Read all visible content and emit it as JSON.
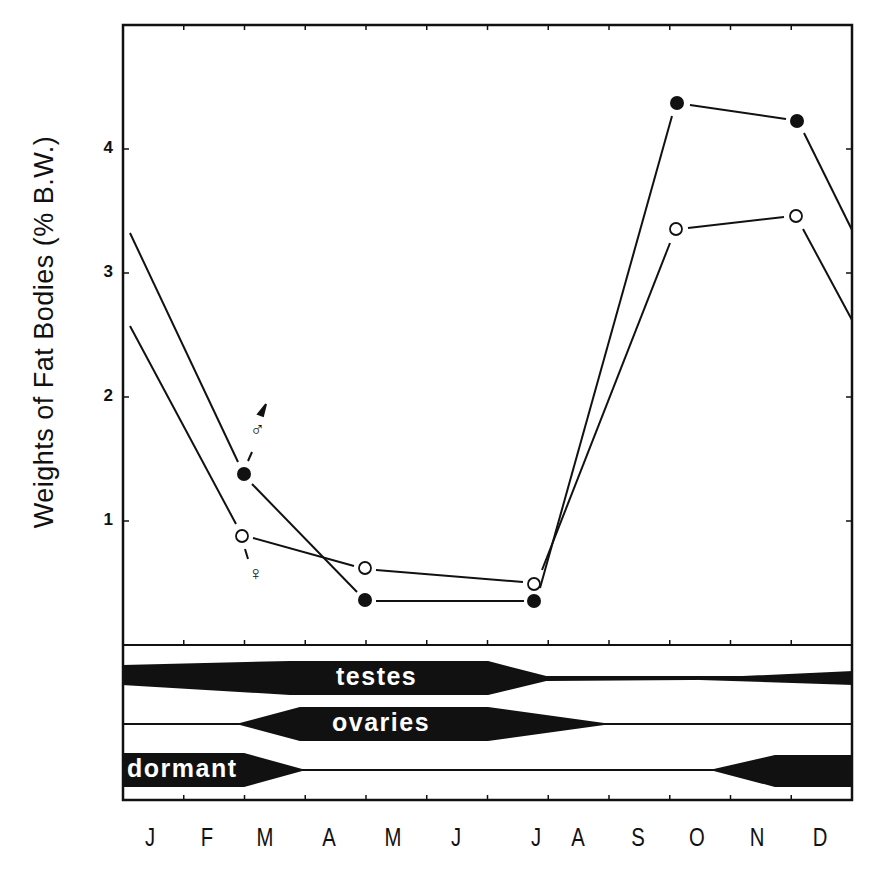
{
  "chart_data": {
    "type": "line",
    "title": "",
    "xlabel": "",
    "ylabel": "Weights of Fat Bodies  (% B.W.)",
    "categories": [
      "J",
      "F",
      "M",
      "A",
      "M",
      "J",
      "J",
      "A",
      "S",
      "O",
      "N",
      "D"
    ],
    "yticks": [
      "1",
      "2",
      "3",
      "4"
    ],
    "ylim": [
      0,
      4.9
    ],
    "grid": false,
    "legend": "inline labels: male symbol next to filled circles, female symbol next to open circles (near March)",
    "series": [
      {
        "name": "male",
        "marker": "filled-circle",
        "points": [
          {
            "month": "M",
            "value": 1.38
          },
          {
            "month": "M (May)",
            "value": 0.36
          },
          {
            "month": "J (Jul)",
            "value": 0.35
          },
          {
            "month": "O",
            "value": 4.36
          },
          {
            "month": "D",
            "value": 4.22
          }
        ],
        "edge_start_value": 3.32,
        "edge_end_value": 3.35
      },
      {
        "name": "female",
        "marker": "open-circle",
        "points": [
          {
            "month": "M",
            "value": 0.88
          },
          {
            "month": "M (May)",
            "value": 0.62
          },
          {
            "month": "J (Jul)",
            "value": 0.49
          },
          {
            "month": "O",
            "value": 3.35
          },
          {
            "month": "D",
            "value": 3.46
          }
        ],
        "edge_start_value": 2.57,
        "edge_end_value": 2.62
      }
    ],
    "bands": [
      {
        "label": "testes",
        "description": "active gonad phase: thick Jan-Jul, tapering off by Aug; thin from Aug, thickening again Nov-Dec"
      },
      {
        "label": "ovaries",
        "description": "thin Jan-Feb, thickening from Mar, thick Apr-Jul, tapering off through Sep; thin Sep-Dec"
      },
      {
        "label": "dormant",
        "description": "thick Jan-Feb, tapering off in Mar; thin Apr-Oct, thickening in Nov; thick Nov-Dec"
      }
    ]
  },
  "labels": {
    "ylabel": "Weights of Fat Bodies  (% B.W.)",
    "yticks": [
      "4",
      "3",
      "2",
      "1"
    ],
    "months": [
      "J",
      "F",
      "M",
      "A",
      "M",
      "J",
      "J",
      "A",
      "S",
      "O",
      "N",
      "D"
    ],
    "male_symbol": "♂",
    "female_symbol": "♀",
    "bands": [
      "testes",
      "ovaries",
      "dormant"
    ]
  }
}
